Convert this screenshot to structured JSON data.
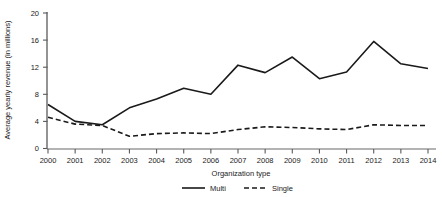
{
  "chart_data": {
    "type": "line",
    "title": "",
    "xlabel": "Organization type",
    "ylabel": "Average yearly revenue (in millions)",
    "x": [
      2000,
      2001,
      2002,
      2003,
      2004,
      2005,
      2006,
      2007,
      2008,
      2009,
      2010,
      2011,
      2012,
      2013,
      2014
    ],
    "xtick_labels": [
      "2000",
      "2001",
      "2002",
      "2003",
      "2004",
      "2005",
      "2006",
      "2007",
      "2008",
      "2009",
      "2010",
      "2011",
      "2012",
      "2013",
      "2014"
    ],
    "ytick_labels": [
      "0",
      "4",
      "8",
      "12",
      "16",
      "20"
    ],
    "yticks": [
      0,
      4,
      8,
      12,
      16,
      20
    ],
    "ylim": [
      0,
      21
    ],
    "grid": false,
    "legend_position": "bottom",
    "series": [
      {
        "name": "Multi",
        "style": "solid",
        "color": "#1a1a1a",
        "values": [
          6.5,
          4.0,
          3.5,
          6.0,
          7.3,
          8.9,
          8.0,
          12.3,
          11.2,
          13.5,
          10.3,
          11.3,
          15.8,
          12.5,
          11.8
        ]
      },
      {
        "name": "Single",
        "style": "dashed",
        "color": "#1a1a1a",
        "values": [
          4.6,
          3.6,
          3.4,
          1.8,
          2.2,
          2.3,
          2.2,
          2.8,
          3.2,
          3.1,
          2.9,
          2.8,
          3.5,
          3.4,
          3.4
        ]
      }
    ]
  },
  "legend": {
    "items": [
      {
        "label": "Multi",
        "style": "solid"
      },
      {
        "label": "Single",
        "style": "dashed"
      }
    ]
  }
}
